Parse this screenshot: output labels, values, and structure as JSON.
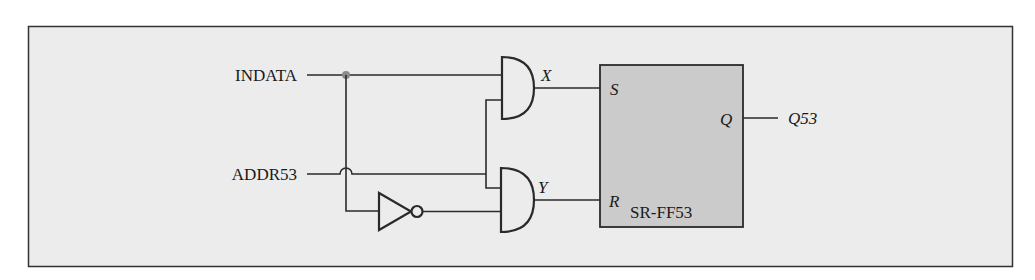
{
  "diagram": {
    "type": "logic-circuit",
    "frame": {
      "background": "#ececec",
      "border": "#333333"
    },
    "inputs": {
      "indata": "INDATA",
      "addr": "ADDR53"
    },
    "gates": {
      "and_top_output": "X",
      "and_bottom_output": "Y",
      "inverter": "NOT"
    },
    "flipflop": {
      "name": "SR-FF53",
      "fill": "#cbcbcb",
      "pins": {
        "set": "S",
        "reset": "R",
        "output": "Q"
      }
    },
    "output": {
      "label": "Q53"
    },
    "junction_color": "#8a8a8a"
  }
}
